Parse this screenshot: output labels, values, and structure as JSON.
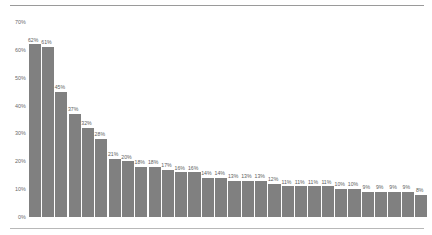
{
  "chart_data": {
    "type": "bar",
    "title": "",
    "subtitle": "",
    "xlabel": "",
    "ylabel": "",
    "ylim": [
      0,
      70
    ],
    "grid": false,
    "legend": null,
    "bar_color": "#808080",
    "label_color": "#5e5e5e",
    "axis_text_color": "#6a6a6a",
    "y_ticks": [
      "0%",
      "10%",
      "20%",
      "30%",
      "40%",
      "50%",
      "60%",
      "70%"
    ],
    "y_tick_values": [
      0,
      10,
      20,
      30,
      40,
      50,
      60,
      70
    ],
    "categories": [
      "1",
      "2",
      "3",
      "4",
      "5",
      "6",
      "7",
      "8",
      "9",
      "10",
      "11",
      "12",
      "13",
      "14",
      "15",
      "16",
      "17",
      "18",
      "19",
      "20",
      "21",
      "22",
      "23",
      "24",
      "25",
      "26",
      "27",
      "28",
      "29",
      "30"
    ],
    "values": [
      62,
      61,
      45,
      37,
      32,
      28,
      21,
      20,
      18,
      18,
      17,
      16,
      16,
      14,
      14,
      13,
      13,
      13,
      12,
      11,
      11,
      11,
      11,
      10,
      10,
      9,
      9,
      9,
      9,
      8
    ],
    "data_labels": [
      "62%",
      "61%",
      "45%",
      "37%",
      "32%",
      "28%",
      "21%",
      "20%",
      "18%",
      "18%",
      "17%",
      "16%",
      "16%",
      "14%",
      "14%",
      "13%",
      "13%",
      "13%",
      "12%",
      "11%",
      "11%",
      "11%",
      "11%",
      "10%",
      "10%",
      "9%",
      "9%",
      "9%",
      "9%",
      "8%"
    ]
  }
}
